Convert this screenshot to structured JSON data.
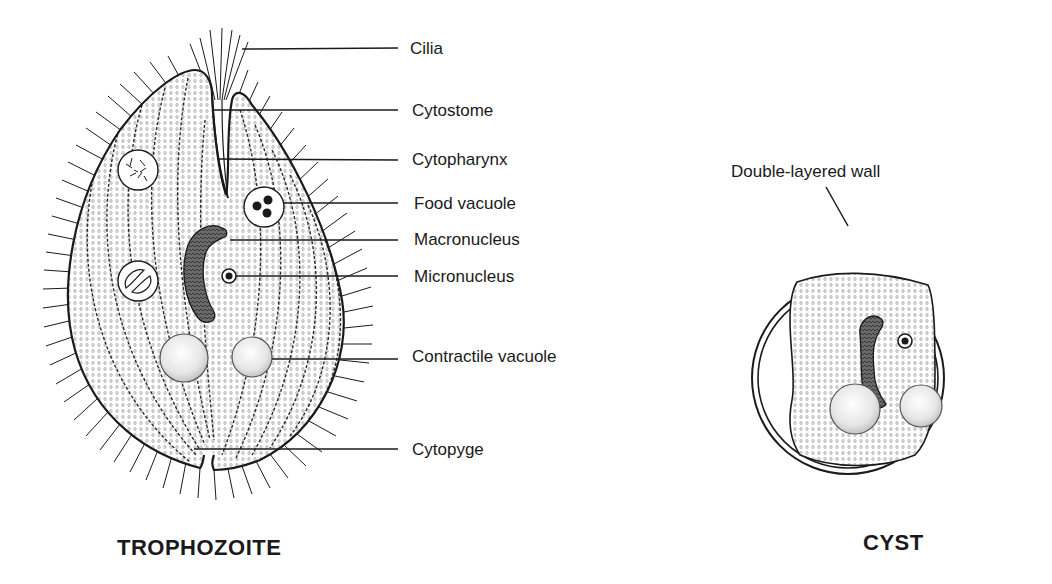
{
  "figure": {
    "panels": [
      {
        "name": "TROPHOZOITE",
        "labels": [
          {
            "text": "Cilia",
            "y": 48
          },
          {
            "text": "Cytostome",
            "y": 111
          },
          {
            "text": "Cytopharynx",
            "y": 160
          },
          {
            "text": "Food vacuole",
            "y": 204
          },
          {
            "text": "Macronucleus",
            "y": 240
          },
          {
            "text": "Micronucleus",
            "y": 276
          },
          {
            "text": "Contractile vacuole",
            "y": 356
          },
          {
            "text": "Cytopyge",
            "y": 449
          }
        ]
      },
      {
        "name": "CYST",
        "labels": [
          {
            "text": "Double-layered wall"
          }
        ]
      }
    ],
    "colors": {
      "outline": "#1a1a1a",
      "stipple": "#9a9a9a",
      "nucleus": "#555555",
      "vacuole": "#e2e2e2",
      "background": "#ffffff"
    }
  }
}
